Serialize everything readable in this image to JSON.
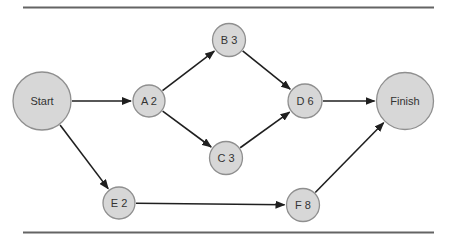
{
  "figure": {
    "background": "#ffffff",
    "rule_color": "#646464",
    "rule_thickness": 2,
    "node_fill": "#d7d7d7",
    "node_stroke": "#8f8f8f",
    "edge_color": "#1f1f1f",
    "label_color": "#333333"
  },
  "diagram": {
    "type": "activity-network",
    "nodes": [
      {
        "id": "start",
        "label": "Start",
        "x": 42,
        "y": 101,
        "r": 29
      },
      {
        "id": "a2",
        "label": "A 2",
        "x": 149,
        "y": 101,
        "r": 16
      },
      {
        "id": "b3",
        "label": "B 3",
        "x": 229,
        "y": 40,
        "r": 16.5
      },
      {
        "id": "c3",
        "label": "C 3",
        "x": 226,
        "y": 158,
        "r": 16.5
      },
      {
        "id": "d6",
        "label": "D 6",
        "x": 305,
        "y": 101,
        "r": 17
      },
      {
        "id": "e2",
        "label": "E 2",
        "x": 119,
        "y": 203,
        "r": 16
      },
      {
        "id": "f8",
        "label": "F 8",
        "x": 303,
        "y": 205,
        "r": 16.5
      },
      {
        "id": "finish",
        "label": "Finish",
        "x": 405,
        "y": 101,
        "r": 28.5
      }
    ],
    "edges": [
      {
        "from": "start",
        "to": "a2"
      },
      {
        "from": "start",
        "to": "e2"
      },
      {
        "from": "a2",
        "to": "b3"
      },
      {
        "from": "a2",
        "to": "c3"
      },
      {
        "from": "b3",
        "to": "d6"
      },
      {
        "from": "c3",
        "to": "d6"
      },
      {
        "from": "d6",
        "to": "finish"
      },
      {
        "from": "e2",
        "to": "f8"
      },
      {
        "from": "f8",
        "to": "finish"
      }
    ],
    "rules": {
      "x1": 23,
      "x2": 434,
      "top_y": 7.5,
      "bottom_y": 232.5
    }
  }
}
